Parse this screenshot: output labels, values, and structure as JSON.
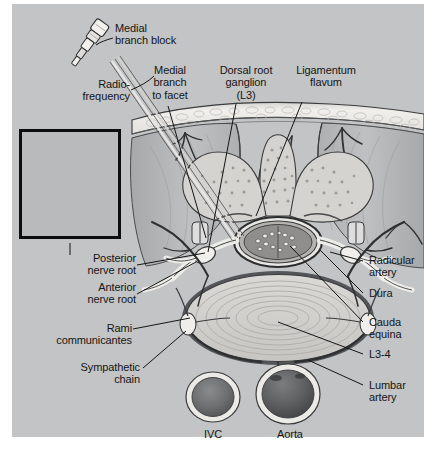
{
  "figure": {
    "panel_color": "#c3c4c5",
    "page_color": "#ffffff",
    "text_color": "#151515"
  },
  "labels": {
    "medial_branch_block": "Medial\nbranch block",
    "radiofrequency": "Radio-\nfrequency",
    "medial_branch_to_facet": "Medial\nbranch\nto facet",
    "dorsal_root_ganglion": "Dorsal root\nganglion\n(L3)",
    "ligamentum_flavum": "Ligamentum\nflavum",
    "posterior_nerve_root": "Posterior\nnerve root",
    "anterior_nerve_root": "Anterior\nnerve root",
    "rami_communicantes": "Rami\ncommunicantes",
    "sympathetic_chain": "Sympathetic\nchain",
    "radicular_artery": "Radicular\nartery",
    "dura": "Dura",
    "cauda_equina": "Cauda\nequina",
    "l3_4": "L3-4",
    "lumbar_artery": "Lumbar\nartery",
    "ivc": "IVC",
    "aorta": "Aorta"
  },
  "colors": {
    "skin_band": "#eceae6",
    "fat_layer": "#e4e2de",
    "muscle": "#b2b3b4",
    "bone": "#d7d5d1",
    "bone_marrow_dot": "#9a9897",
    "disc": "#cfcecb",
    "disc_ring": "#b6b5b2",
    "nerve": "#efeeea",
    "vessel_dark": "#3f4042",
    "cord": "#8d8c8a",
    "needle": "#e8e7e4",
    "outline": "#2a2b2d",
    "vessel_lumen": "#6e6f70",
    "aorta_lumen": "#5c5d5e"
  }
}
